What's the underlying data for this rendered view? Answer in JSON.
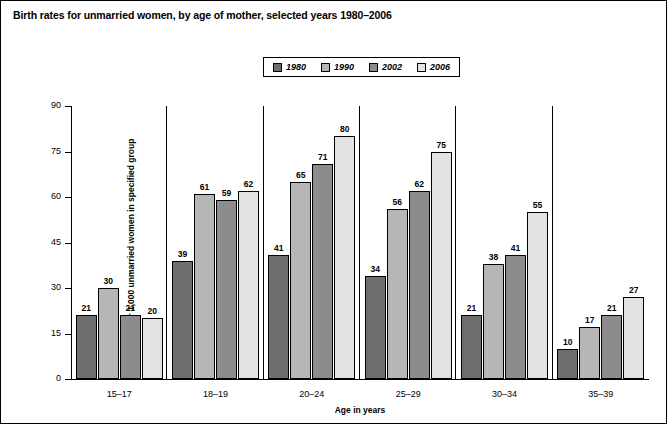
{
  "chart_data": {
    "type": "bar",
    "title": "Birth rates for unmarried women, by age of mother, selected years 1980–2006",
    "xlabel": "Age in years",
    "ylabel": "Rate per 1,000 unmarried women in specified group",
    "categories": [
      "15–17",
      "18–19",
      "20–24",
      "25–29",
      "30–34",
      "35–39"
    ],
    "series": [
      {
        "name": "1980",
        "color": "#6e6e6e",
        "values": [
          21,
          39,
          41,
          34,
          21,
          10
        ]
      },
      {
        "name": "1990",
        "color": "#b6b6b6",
        "values": [
          30,
          61,
          65,
          56,
          38,
          17
        ]
      },
      {
        "name": "2002",
        "color": "#8c8c8c",
        "values": [
          21,
          59,
          71,
          62,
          41,
          21
        ]
      },
      {
        "name": "2006",
        "color": "#e3e3e3",
        "values": [
          20,
          62,
          80,
          75,
          55,
          27
        ]
      }
    ],
    "ylim": [
      0,
      90
    ],
    "yticks": [
      0,
      15,
      30,
      45,
      60,
      75,
      90
    ],
    "grid": false,
    "legend_position": "top-center"
  }
}
